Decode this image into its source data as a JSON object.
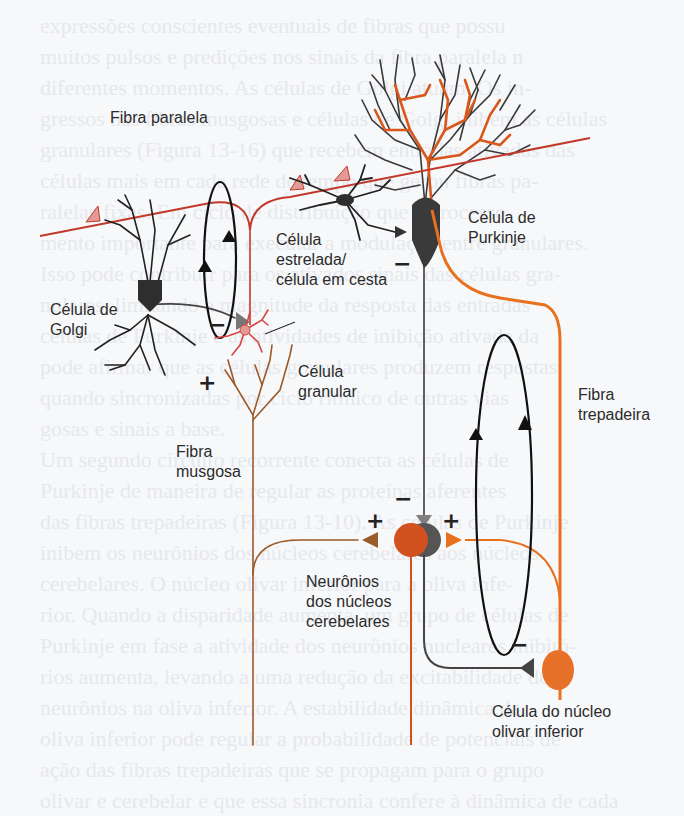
{
  "background_text": {
    "lines": [
      "expressões conscientes eventuais de fibras que possu",
      "muitos pulsos e predições nos sinais da fibra paralela n",
      "diferentes momentos. As células de Golgi atuam. Os in-",
      "gressos nas fibras musgosas e células de Golgi inibem as células",
      "granulares (Figura 13-16) que recebem entradas ativadas das",
      "células mais em cada rede de tempo que gerou fibras pa-",
      "ralelas fixas. Em ciclo de distribuição que é processo-",
      "mento importante para executar a modulação entre granulares.",
      "Isso pode contribuir para os ativados sinais das células gra-",
      "nulares, limitando a magnitude da resposta das entradas",
      "células de Purkinje e as atividades de inibição ativada da",
      "pode afirmar que as células granulares produzem respostas",
      "quando sincronizadas por ciclo rítmico de outras vias",
      "gosas e sinais a base.",
      "Um segundo circuito recorrente conecta as células de",
      "Purkinje de maneira de regular as proteínas aferentes",
      "das fibras trepadeiras (Figura 13-10). As células de Purkinje",
      "inibem os neurônios dos núcleos cerebelares aos núcleos",
      "cerebelares. O núcleo olivar inferior para a oliva infe-",
      "rior. Quando a disparidade aumenta, um grupo de células de",
      "Purkinje em fase a atividade dos neurônios nucleares inibitó-",
      "rios aumenta, levando a uma redução da excitabilidade dos",
      "neurônios na oliva inferior. A estabilidade dinâmica da",
      "oliva inferior pode regular a probabilidade de potenciais de",
      "ação das fibras trepadeiras que se propagam para o grupo",
      "olivar e cerebelar e que essa sincronia confere à dinâmica de cada",
      "região de entrada. O efeito das fibras trepadeiras",
      "Na parte cerebelar e cerebelo, sendo assim o que"
    ]
  },
  "diagram": {
    "colors": {
      "parallel_fiber": "#c0392b",
      "purkinje_dendrite_orange": "#d9571a",
      "climbing_fiber": "#e8701f",
      "mossy_fiber": "#9a5a2a",
      "neuron_dark": "#3a3a3a",
      "synapse_gray": "#808080",
      "synapse_pink": "#e39a95",
      "nuclear_orange": "#d3501f",
      "olive_orange": "#e8712a"
    },
    "labels": {
      "parallel_fiber": "Fibra paralela",
      "purkinje_line1": "Célula de",
      "purkinje_line2": "Purkinje",
      "stellate_line1": "Célula",
      "stellate_line2": "estrelada/",
      "stellate_line3": "célula em cesta",
      "golgi_line1": "Célula de",
      "golgi_line2": "Golgi",
      "granule_line1": "Célula",
      "granule_line2": "granular",
      "mossy_line1": "Fibra",
      "mossy_line2": "musgosa",
      "climbing_line1": "Fibra",
      "climbing_line2": "trepadeira",
      "nuclei_line1": "Neurônios",
      "nuclei_line2": "dos núcleos",
      "nuclei_line3": "cerebelares",
      "olive_line1": "Célula do núcleo",
      "olive_line2": "olivar inferior"
    },
    "signs": {
      "stellate_inhibit": "−",
      "golgi_inhibit": "−",
      "mossy_excite": "+",
      "purkinje_to_nuclei": "−",
      "mossy_to_nuclei": "+",
      "climbing_to_nuclei": "+",
      "nuclei_to_olive": "−"
    }
  }
}
